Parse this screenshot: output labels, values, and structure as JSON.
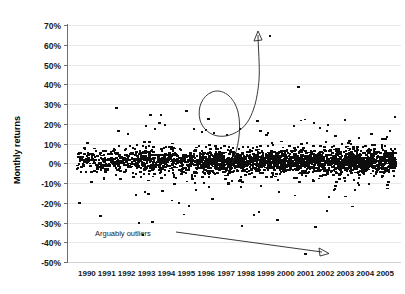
{
  "chart_data": {
    "type": "scatter",
    "title": "",
    "xlabel": "",
    "ylabel": "Monthly returns",
    "xlim": [
      1990,
      2006
    ],
    "ylim": [
      -50,
      70
    ],
    "ytick_labels": [
      "70%",
      "60%",
      "50%",
      "40%",
      "30%",
      "20%",
      "10%",
      "0%",
      "-10%",
      "-20%",
      "-30%",
      "-40%",
      "-50%"
    ],
    "ytick_values": [
      70,
      60,
      50,
      40,
      30,
      20,
      10,
      0,
      -10,
      -20,
      -30,
      -40,
      -50
    ],
    "xtick_labels": [
      "1990",
      "1991",
      "1992",
      "1993",
      "1994",
      "1995",
      "1996",
      "1997",
      "1998",
      "1999",
      "2000",
      "2001",
      "2002",
      "2003",
      "2004",
      "2005"
    ],
    "xtick_values": [
      1990,
      1991,
      1992,
      1993,
      1994,
      1995,
      1996,
      1997,
      1998,
      1999,
      2000,
      2001,
      2002,
      2003,
      2004,
      2005
    ],
    "grid": true,
    "legend": "none",
    "marker": "square",
    "marker_color": "#0d0d0d",
    "grid_color": "#e8e8e8",
    "axis_color": "#6e6e6e",
    "annotations": [
      {
        "name": "outlier-label",
        "text": "Arguably outliers",
        "x_px": 95,
        "y_px": 236
      },
      {
        "name": "high-outlier-arrow",
        "style": "s-curve",
        "target_point": {
          "x": 1999.6,
          "y": 63
        },
        "source_point": {
          "x": 1999.0,
          "y": 8
        }
      },
      {
        "name": "low-outlier-arrow",
        "style": "straight",
        "target_point": {
          "x": 2001.2,
          "y": -46
        },
        "source_point": {
          "x": 1994.0,
          "y": -34
        }
      }
    ],
    "notable_outliers": [
      {
        "x": 1999.7,
        "y": 64.5
      },
      {
        "x": 2001.5,
        "y": -46.0
      },
      {
        "x": 1992.0,
        "y": 28.0
      },
      {
        "x": 1995.5,
        "y": 26.5
      },
      {
        "x": 1993.7,
        "y": 24.5
      },
      {
        "x": 1998.3,
        "y": -32.0
      },
      {
        "x": 2000.1,
        "y": -29.0
      },
      {
        "x": 1998.9,
        "y": -26.5
      },
      {
        "x": 1992.1,
        "y": 16.0
      },
      {
        "x": 1996.6,
        "y": 22.5
      }
    ],
    "series": [
      {
        "name": "Monthly returns",
        "n_points": 2600,
        "center": 1.0,
        "spread": 5.5,
        "description": "Dense cloud of monthly stock returns clustered near 0%, spanning 1990-2005, with a heavy tail of scattered points between -35% and +30% and two extreme outliers."
      }
    ]
  }
}
